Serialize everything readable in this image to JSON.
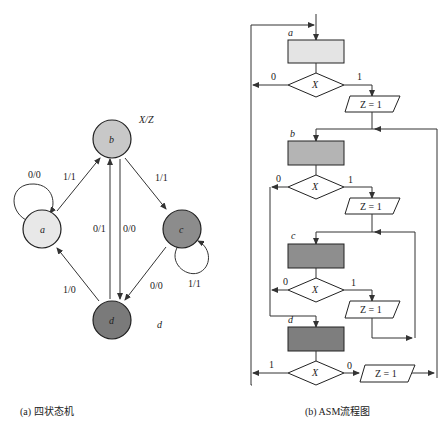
{
  "left_diagram": {
    "caption": "(a) 四状态机",
    "legend": "X/Z",
    "extra_label": "d",
    "states": [
      {
        "id": "a",
        "label": "a",
        "color": "#e8e8e8"
      },
      {
        "id": "b",
        "label": "b",
        "color": "#c8c8c8"
      },
      {
        "id": "c",
        "label": "c",
        "color": "#8c8c8c"
      },
      {
        "id": "d",
        "label": "d",
        "color": "#7a7a7a"
      }
    ],
    "transitions": [
      {
        "from": "a",
        "to": "a",
        "label": "0/0"
      },
      {
        "from": "a",
        "to": "b",
        "label": "1/1"
      },
      {
        "from": "b",
        "to": "c",
        "label": "1/1"
      },
      {
        "from": "b",
        "to": "d",
        "label": "0/0"
      },
      {
        "from": "d",
        "to": "b",
        "label": "0/1"
      },
      {
        "from": "c",
        "to": "c",
        "label": "1/1"
      },
      {
        "from": "c",
        "to": "d",
        "label": "0/0"
      },
      {
        "from": "d",
        "to": "a",
        "label": "1/0"
      }
    ]
  },
  "right_diagram": {
    "caption": "(b) ASM流程图",
    "states": [
      {
        "id": "a",
        "label": "a",
        "color": "#e4e4e4"
      },
      {
        "id": "b",
        "label": "b",
        "color": "#b4b4b4"
      },
      {
        "id": "c",
        "label": "c",
        "color": "#8e8e8e"
      },
      {
        "id": "d",
        "label": "d",
        "color": "#7e7e7e"
      }
    ],
    "decisions": [
      {
        "state": "a",
        "label": "X",
        "left": "0",
        "right": "1"
      },
      {
        "state": "b",
        "label": "X",
        "left": "0",
        "right": "1"
      },
      {
        "state": "c",
        "label": "X",
        "left": "0",
        "right": "1"
      },
      {
        "state": "d",
        "label": "X",
        "left": "1",
        "right": "0"
      }
    ],
    "outputs": [
      {
        "label": "Z = 1"
      },
      {
        "label": "Z = 1"
      },
      {
        "label": "Z = 1"
      },
      {
        "label": "Z = 1"
      }
    ]
  }
}
